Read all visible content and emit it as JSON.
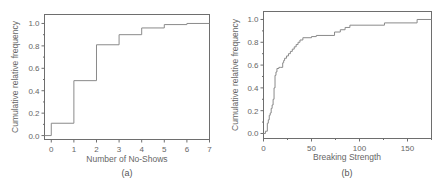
{
  "chart_data": [
    {
      "id": "a",
      "type": "line",
      "step": true,
      "caption": "(a)",
      "title": "",
      "xlabel": "Number of No-Shows",
      "ylabel": "Cumulative relative frequency",
      "xlim": [
        -0.3,
        7
      ],
      "ylim": [
        -0.035,
        1.08
      ],
      "xticks": [
        0,
        1,
        2,
        3,
        4,
        5,
        6,
        7
      ],
      "yticks": [
        0.0,
        0.2,
        0.4,
        0.6,
        0.8,
        1.0
      ],
      "ytick_labels": [
        "0.0",
        "0.2",
        "0.4",
        "0.6",
        "0.8",
        "1.0"
      ],
      "grid": false,
      "series": [
        {
          "name": "Cumulative relative frequency",
          "x": [
            -0.3,
            0,
            1,
            2,
            3,
            4,
            5,
            6,
            7
          ],
          "y": [
            0.0,
            0.11,
            0.49,
            0.81,
            0.9,
            0.96,
            0.99,
            1.0,
            1.0
          ]
        }
      ]
    },
    {
      "id": "b",
      "type": "line",
      "step": true,
      "caption": "(b)",
      "title": "",
      "xlabel": "Breaking Strength",
      "ylabel": "Cumulative relative frequency",
      "xlim": [
        0,
        175
      ],
      "ylim": [
        -0.044,
        1.07
      ],
      "xticks": [
        0,
        50,
        100,
        150
      ],
      "xminor": [
        25,
        75,
        125,
        175
      ],
      "yticks": [
        0.0,
        0.2,
        0.4,
        0.6,
        0.8,
        1.0
      ],
      "ytick_labels": [
        "0.0",
        "0.2",
        "0.4",
        "0.6",
        "0.8",
        "1.0"
      ],
      "grid": false,
      "series": [
        {
          "name": "Cumulative relative frequency",
          "x": [
            2,
            4,
            5,
            6,
            7,
            8,
            9,
            10,
            11,
            12,
            13,
            14,
            16,
            18,
            20,
            21,
            22,
            24,
            26,
            28,
            30,
            32,
            34,
            36,
            38,
            41,
            50,
            55,
            74,
            80,
            85,
            90,
            126,
            160,
            175
          ],
          "y": [
            0.02,
            0.09,
            0.12,
            0.16,
            0.18,
            0.22,
            0.25,
            0.3,
            0.4,
            0.51,
            0.54,
            0.57,
            0.58,
            0.58,
            0.62,
            0.64,
            0.66,
            0.68,
            0.7,
            0.72,
            0.74,
            0.76,
            0.78,
            0.8,
            0.82,
            0.84,
            0.85,
            0.86,
            0.89,
            0.91,
            0.93,
            0.95,
            0.97,
            1.0,
            1.0
          ]
        }
      ]
    }
  ]
}
